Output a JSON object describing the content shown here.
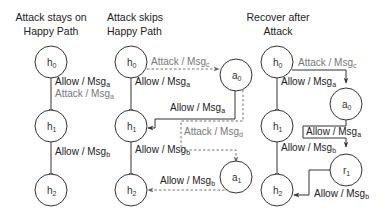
{
  "diagram": {
    "panels": [
      {
        "title_line1": "Attack stays on",
        "title_line2": "Happy Path",
        "nodes": [
          {
            "id": "h0",
            "base": "h",
            "sub": "0"
          },
          {
            "id": "h1",
            "base": "h",
            "sub": "1"
          },
          {
            "id": "h2",
            "base": "h",
            "sub": "2"
          }
        ],
        "edges": [
          {
            "from": "h0",
            "to": "h1",
            "style": "solid",
            "labels": [
              {
                "pre": "Allow /  Msg",
                "sub": "a",
                "color": "black"
              },
              {
                "pre": "Attack /  Msg",
                "sub": "a",
                "color": "gray"
              }
            ]
          },
          {
            "from": "h1",
            "to": "h2",
            "style": "solid",
            "labels": [
              {
                "pre": "Allow /  Msg",
                "sub": "b",
                "color": "black"
              }
            ]
          }
        ]
      },
      {
        "title_line1": "Attack skips",
        "title_line2": "Happy Path",
        "nodes": [
          {
            "id": "h0",
            "base": "h",
            "sub": "0"
          },
          {
            "id": "h1",
            "base": "h",
            "sub": "1"
          },
          {
            "id": "h2",
            "base": "h",
            "sub": "2"
          },
          {
            "id": "a0",
            "base": "a",
            "sub": "0"
          },
          {
            "id": "a1",
            "base": "a",
            "sub": "1"
          }
        ],
        "edges": [
          {
            "from": "h0",
            "to": "a0",
            "style": "dashed",
            "labels": [
              {
                "pre": "Attack / Msg",
                "sub": "c",
                "color": "gray"
              }
            ]
          },
          {
            "from": "h0",
            "to": "h1",
            "style": "solid",
            "labels": [
              {
                "pre": "Allow /  Msg",
                "sub": "a",
                "color": "black"
              }
            ]
          },
          {
            "from": "a0",
            "to": "h1",
            "style": "solid",
            "labels": [
              {
                "pre": "Allow /  Msg",
                "sub": "a",
                "color": "black"
              }
            ]
          },
          {
            "from": "a0",
            "to": "a1",
            "style": "dashed",
            "labels": [
              {
                "pre": "Attack / Msg",
                "sub": "d",
                "color": "gray"
              }
            ]
          },
          {
            "from": "h1",
            "to": "h2",
            "style": "solid",
            "labels": [
              {
                "pre": "Allow / Msg",
                "sub": "b",
                "color": "black"
              }
            ]
          },
          {
            "from": "a1",
            "to": "h2",
            "style": "dashed",
            "labels": [
              {
                "pre": "Allow / Msg",
                "sub": "b",
                "color": "black"
              }
            ]
          }
        ]
      },
      {
        "title_line1": "Recover after",
        "title_line2": "Attack",
        "nodes": [
          {
            "id": "h0",
            "base": "h",
            "sub": "0"
          },
          {
            "id": "h1",
            "base": "h",
            "sub": "1"
          },
          {
            "id": "h2",
            "base": "h",
            "sub": "2"
          },
          {
            "id": "a0",
            "base": "a",
            "sub": "0"
          },
          {
            "id": "r1",
            "base": "r",
            "sub": "1"
          }
        ],
        "edges": [
          {
            "from": "h0",
            "to": "a0",
            "style": "solid",
            "labels": [
              {
                "pre": "Attack / Msg",
                "sub": "c",
                "color": "gray"
              }
            ]
          },
          {
            "from": "h0",
            "to": "h1",
            "style": "solid",
            "labels": [
              {
                "pre": "Allow /  Msg",
                "sub": "a",
                "color": "black"
              }
            ]
          },
          {
            "from": "a0",
            "to": "r1",
            "style": "solid",
            "labels": [
              {
                "pre": "Allow /  Msg",
                "sub": "a",
                "color": "black"
              }
            ]
          },
          {
            "from": "h1",
            "to": "h2",
            "style": "solid",
            "labels": [
              {
                "pre": "Allow / Msg",
                "sub": "b",
                "color": "black"
              }
            ]
          },
          {
            "from": "r1",
            "to": "h2",
            "style": "solid",
            "labels": [
              {
                "pre": "Allow / Msg",
                "sub": "b",
                "color": "black"
              }
            ]
          }
        ]
      }
    ]
  }
}
